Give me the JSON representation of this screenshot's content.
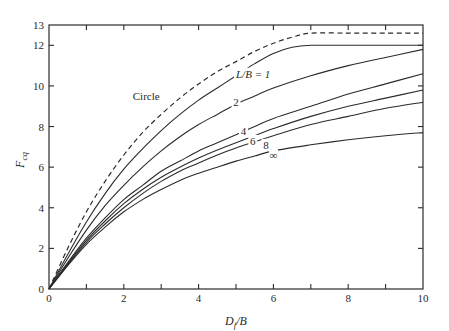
{
  "chart_data": {
    "type": "line",
    "title": "",
    "xlabel": "D_f/B",
    "ylabel": "F_cq",
    "xlim": [
      0,
      10
    ],
    "ylim": [
      0,
      13
    ],
    "xticks": [
      0,
      2,
      4,
      6,
      8,
      10
    ],
    "xticks_minor": [
      1,
      3,
      5,
      7,
      9
    ],
    "yticks": [
      0,
      2,
      4,
      6,
      8,
      10,
      12,
      13
    ],
    "grid": false,
    "legend": "inline curve labels",
    "series": [
      {
        "name": "Circle",
        "style": "dashed",
        "label": "Circle",
        "x": [
          0,
          0.5,
          1,
          1.5,
          2,
          2.5,
          3,
          3.5,
          4,
          4.5,
          5,
          5.5,
          6,
          6.5,
          7,
          8,
          9,
          10
        ],
        "y": [
          0,
          2.0,
          3.8,
          5.3,
          6.6,
          7.7,
          8.6,
          9.4,
          10.1,
          10.7,
          11.2,
          11.7,
          12.1,
          12.4,
          12.6,
          12.6,
          12.6,
          12.6
        ]
      },
      {
        "name": "L/B = 1",
        "style": "solid",
        "label": "L/B = 1",
        "x": [
          0,
          0.5,
          1,
          1.5,
          2,
          2.5,
          3,
          3.5,
          4,
          4.5,
          5,
          5.5,
          6,
          6.5,
          7,
          8,
          9,
          10
        ],
        "y": [
          0,
          1.7,
          3.3,
          4.7,
          5.9,
          6.9,
          7.8,
          8.6,
          9.3,
          9.9,
          10.5,
          11.1,
          11.6,
          11.9,
          12.0,
          12.0,
          12.0,
          12.0
        ]
      },
      {
        "name": "L/B = 2",
        "style": "solid",
        "label": "2",
        "x": [
          0,
          0.5,
          1,
          1.5,
          2,
          2.5,
          3,
          3.5,
          4,
          4.5,
          5,
          5.5,
          6,
          7,
          8,
          9,
          10
        ],
        "y": [
          0,
          1.5,
          2.9,
          4.1,
          5.1,
          6.0,
          6.8,
          7.5,
          8.1,
          8.6,
          9.1,
          9.5,
          9.9,
          10.5,
          11.0,
          11.4,
          11.8
        ]
      },
      {
        "name": "L/B = 4",
        "style": "solid",
        "label": "4",
        "x": [
          0,
          0.5,
          1,
          1.5,
          2,
          2.5,
          3,
          3.5,
          4,
          4.5,
          5,
          5.5,
          6,
          7,
          8,
          9,
          10
        ],
        "y": [
          0,
          1.3,
          2.5,
          3.5,
          4.4,
          5.1,
          5.8,
          6.3,
          6.8,
          7.2,
          7.6,
          8.0,
          8.4,
          9.0,
          9.6,
          10.1,
          10.6
        ]
      },
      {
        "name": "L/B = 6",
        "style": "solid",
        "label": "6",
        "x": [
          0,
          0.5,
          1,
          1.5,
          2,
          2.5,
          3,
          3.5,
          4,
          4.5,
          5,
          5.5,
          6,
          7,
          8,
          9,
          10
        ],
        "y": [
          0,
          1.25,
          2.4,
          3.35,
          4.2,
          4.9,
          5.5,
          6.0,
          6.45,
          6.85,
          7.2,
          7.55,
          7.9,
          8.5,
          9.0,
          9.4,
          9.8
        ]
      },
      {
        "name": "L/B = 8",
        "style": "solid",
        "label": "8",
        "x": [
          0,
          0.5,
          1,
          1.5,
          2,
          2.5,
          3,
          3.5,
          4,
          4.5,
          5,
          5.5,
          6,
          7,
          8,
          9,
          10
        ],
        "y": [
          0,
          1.2,
          2.3,
          3.2,
          4.0,
          4.7,
          5.3,
          5.8,
          6.2,
          6.6,
          6.95,
          7.25,
          7.55,
          8.1,
          8.5,
          8.9,
          9.2
        ]
      },
      {
        "name": "L/B = ∞",
        "style": "solid",
        "label": "∞",
        "x": [
          0,
          0.5,
          1,
          1.5,
          2,
          2.5,
          3,
          3.5,
          4,
          4.5,
          5,
          5.5,
          6,
          7,
          8,
          9,
          10
        ],
        "y": [
          0,
          1.15,
          2.2,
          3.05,
          3.8,
          4.4,
          4.9,
          5.35,
          5.7,
          6.0,
          6.3,
          6.55,
          6.8,
          7.1,
          7.35,
          7.55,
          7.7
        ]
      }
    ],
    "annotations": [
      {
        "text": "Circle",
        "x": 2.6,
        "y": 9.4
      },
      {
        "text": "L/B = 1",
        "x": 5.0,
        "y": 10.5
      },
      {
        "text": "2",
        "x": 5.0,
        "y": 9.1
      },
      {
        "text": "4",
        "x": 5.2,
        "y": 7.7
      },
      {
        "text": "6",
        "x": 5.45,
        "y": 7.2
      },
      {
        "text": "8",
        "x": 5.8,
        "y": 7.0
      },
      {
        "text": "∞",
        "x": 6.0,
        "y": 6.5
      }
    ]
  },
  "axes": {
    "x_label_main": "D",
    "x_label_sub": "f",
    "x_label_rest": "/B",
    "y_label_main": "F",
    "y_label_sub": "cq"
  }
}
